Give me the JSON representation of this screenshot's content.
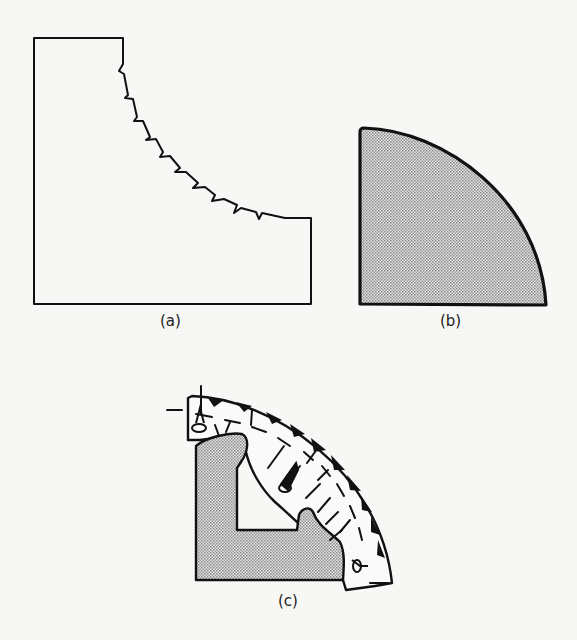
{
  "figure": {
    "panels": [
      {
        "id": "a",
        "label": "(a)",
        "description": "Rectangular block with a concave quarter-circle cutout whose edge shows a jagged, stepped profile"
      },
      {
        "id": "b",
        "label": "(b)",
        "description": "Shaded quarter-circle solid with a thick outline"
      },
      {
        "id": "c",
        "label": "(c)",
        "description": "Shaded L-shaped core surrounded by an arched band containing dashed contour lines, blackened triangular teeth along the outer arc, and small cavity/pin markers at the ends and middle"
      }
    ],
    "colors": {
      "background": "#f7f7f5",
      "ink": "#111111",
      "shade": "#bdbdbd"
    }
  }
}
